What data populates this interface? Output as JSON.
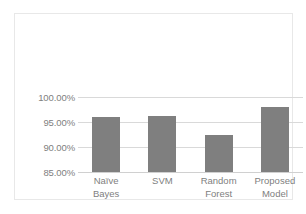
{
  "chart_data": {
    "type": "bar",
    "title": "",
    "subtitle": "",
    "xlabel": "",
    "ylabel": "",
    "categories": [
      "Naïve Bayes",
      "SVM",
      "Random Forest",
      "Proposed Model"
    ],
    "category_lines": [
      [
        "Naïve",
        "Bayes"
      ],
      [
        "SVM",
        ""
      ],
      [
        "Random",
        "Forest"
      ],
      [
        "Proposed",
        "Model"
      ]
    ],
    "values": [
      96.0,
      96.2,
      92.4,
      98.0
    ],
    "value_unit": "%",
    "ylim": [
      85,
      100
    ],
    "ytick_values": [
      85,
      90,
      95,
      100
    ],
    "ytick_labels": [
      "85.00%",
      "90.00%",
      "95.00%",
      "100.00%"
    ],
    "grid": true,
    "legend": "none",
    "series": [
      {
        "name": "Accuracy",
        "values": [
          96.0,
          96.2,
          92.4,
          98.0
        ]
      }
    ],
    "colors": {
      "bar": "#7f7f7f",
      "gridline": "#d9d9d9",
      "axis_text": "#808080",
      "frame_border": "#e8e8e8",
      "background": "#ffffff"
    }
  }
}
